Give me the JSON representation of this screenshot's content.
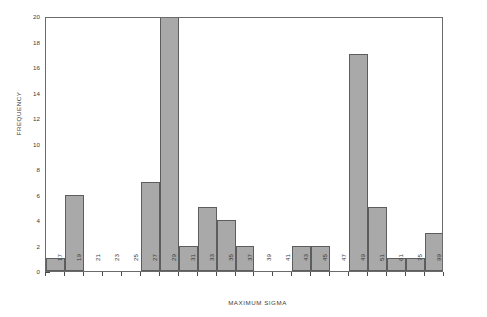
{
  "chart_data": {
    "type": "bar",
    "title": "",
    "subtitle": "",
    "xlabel": "MAXIMUM SIGMA",
    "ylabel": "FREQUENCY",
    "categories": [
      "17",
      "19",
      "21",
      "23",
      "25",
      "27",
      "29",
      "31",
      "33",
      "35",
      "37",
      "39",
      "41",
      "43",
      "45",
      "47",
      "49",
      "51",
      "61",
      "75",
      "99"
    ],
    "values": [
      1,
      6,
      0,
      0,
      0,
      7,
      20,
      2,
      5,
      4,
      2,
      0,
      0,
      2,
      2,
      0,
      17,
      5,
      1,
      1,
      3
    ],
    "ylim": [
      0,
      20
    ],
    "ytick_values": [
      0,
      2,
      4,
      6,
      8,
      10,
      12,
      14,
      16,
      18,
      20
    ],
    "ytick_labels": [
      "0",
      "2",
      "4",
      "6",
      "8",
      "10",
      "12",
      "14",
      "16",
      "18",
      "20"
    ],
    "grid": false,
    "legend": null,
    "bar_color": "#a9a9a9",
    "bar_edge_color": "#5d5d5d",
    "frame_color": "#6b6b6b",
    "text_color": "#3b3b3b",
    "xtick_rotation": 90
  }
}
